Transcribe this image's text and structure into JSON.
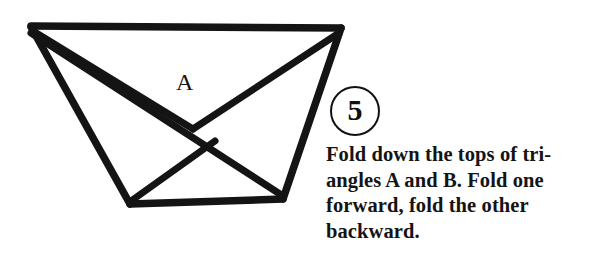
{
  "page": {
    "background_color": "#ffffff",
    "ink_color": "#111111",
    "width": 601,
    "height": 261
  },
  "diagram": {
    "name": "folded-paper-diagram",
    "stroke_color": "#141414",
    "stroke_width": 7,
    "labels": [
      {
        "text": "A",
        "x": 188,
        "y": 88
      }
    ],
    "vertices": {
      "top_left": [
        32,
        26
      ],
      "top_right": [
        341,
        28
      ],
      "bottom_left": [
        130,
        204
      ],
      "bottom_right": [
        283,
        199
      ],
      "inner_apex": [
        191,
        127
      ],
      "crease_low": [
        175,
        118
      ]
    }
  },
  "instruction": {
    "step_number": "5",
    "lines": [
      "Fold down the tops of tri-",
      "angles A and B. Fold one",
      "forward, fold the other",
      "backward."
    ],
    "full_text": "Fold down the tops of triangles A and B. Fold one forward, fold the other backward."
  }
}
